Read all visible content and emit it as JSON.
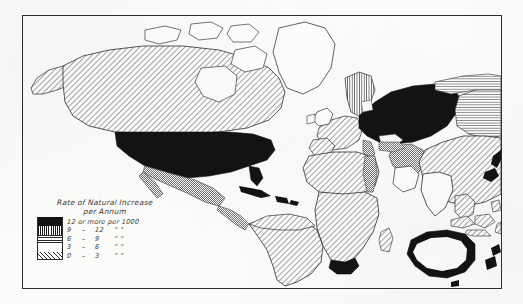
{
  "plate": {
    "kind": "printed-map-plate",
    "background_color": "#fdfdfb",
    "frame_color": "#2e2e2e"
  },
  "legend": {
    "title_line1": "Rate of Natural Increase",
    "title_line2": "per Annum",
    "head_row": {
      "swatch": "solid-black",
      "text": "12 or more per 1000"
    },
    "rows": [
      {
        "swatch": "vertical-hatch",
        "low": "9",
        "dash": "–",
        "high": "12",
        "unit": "”       ”"
      },
      {
        "swatch": "horizontal-lines",
        "low": "6",
        "dash": "–",
        "high": "9",
        "unit": "”       ”"
      },
      {
        "swatch": "blank-white",
        "low": "3",
        "dash": "–",
        "high": "6",
        "unit": "”       ”"
      },
      {
        "swatch": "diagonal-hatch",
        "low": "0",
        "dash": "–",
        "high": "3",
        "unit": "”       ”"
      }
    ]
  },
  "map_regions": [
    {
      "name": "canada",
      "fill": "diagonal-hatch",
      "class_label": "0 - 3 per 1000"
    },
    {
      "name": "alaska",
      "fill": "diagonal-hatch",
      "class_label": "0 - 3 per 1000"
    },
    {
      "name": "greenland",
      "fill": "blank-white",
      "class_label": "unclassified"
    },
    {
      "name": "united-states",
      "fill": "solid-black",
      "class_label": "12 or more per 1000"
    },
    {
      "name": "mexico",
      "fill": "gray-tone",
      "class_label": "intermediate"
    },
    {
      "name": "central-america",
      "fill": "gray-tone",
      "class_label": "intermediate"
    },
    {
      "name": "caribbean",
      "fill": "solid-black",
      "class_label": "12 or more per 1000"
    },
    {
      "name": "south-america",
      "fill": "diagonal-hatch",
      "class_label": "0 - 3 per 1000"
    },
    {
      "name": "western-europe",
      "fill": "diagonal-hatch",
      "class_label": "0 - 3 per 1000"
    },
    {
      "name": "british-isles",
      "fill": "blank-white",
      "class_label": "3 - 6 per 1000"
    },
    {
      "name": "scandinavia",
      "fill": "vertical-hatch",
      "class_label": "9 - 12 per 1000"
    },
    {
      "name": "central-europe-russia",
      "fill": "solid-black",
      "class_label": "12 or more per 1000"
    },
    {
      "name": "siberia",
      "fill": "horizontal-lines",
      "class_label": "6 - 9 per 1000"
    },
    {
      "name": "north-africa",
      "fill": "diagonal-hatch",
      "class_label": "0 - 3 per 1000"
    },
    {
      "name": "nile-valley",
      "fill": "gray-tone",
      "class_label": "intermediate"
    },
    {
      "name": "sub-saharan-africa",
      "fill": "diagonal-hatch",
      "class_label": "0 - 3 per 1000"
    },
    {
      "name": "south-africa",
      "fill": "solid-black",
      "class_label": "12 or more per 1000"
    },
    {
      "name": "madagascar",
      "fill": "diagonal-hatch",
      "class_label": "0 - 3 per 1000"
    },
    {
      "name": "middle-east",
      "fill": "gray-tone",
      "class_label": "intermediate"
    },
    {
      "name": "india",
      "fill": "blank-white",
      "class_label": "3 - 6 per 1000"
    },
    {
      "name": "china-east-asia",
      "fill": "diagonal-hatch",
      "class_label": "0 - 3 per 1000"
    },
    {
      "name": "japan",
      "fill": "solid-black",
      "class_label": "12 or more per 1000"
    },
    {
      "name": "southeast-asia",
      "fill": "diagonal-hatch",
      "class_label": "0 - 3 per 1000"
    },
    {
      "name": "australia",
      "fill": "black-outline-white-interior",
      "class_label": "3 - 6 per 1000"
    },
    {
      "name": "new-zealand",
      "fill": "solid-black",
      "class_label": "12 or more per 1000"
    }
  ]
}
